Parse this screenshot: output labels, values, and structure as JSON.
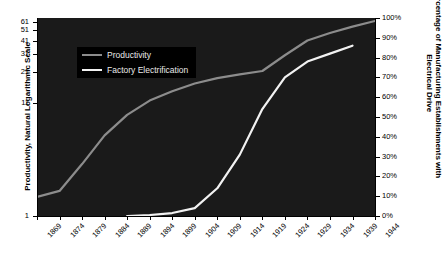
{
  "chart_data": {
    "type": "line",
    "title": "",
    "xlabel": "",
    "background": "#1a1a1a",
    "grid": false,
    "legend_position": "top-left",
    "x": [
      1869,
      1874,
      1879,
      1884,
      1889,
      1894,
      1899,
      1904,
      1909,
      1914,
      1919,
      1924,
      1929,
      1934,
      1939,
      1944
    ],
    "x_tick_labels": [
      "1869",
      "1874",
      "1879",
      "1884",
      "1889",
      "1894",
      "1899",
      "1904",
      "1909",
      "1914",
      "1919",
      "1924",
      "1929",
      "1934",
      "1939",
      "1944"
    ],
    "axes": [
      {
        "id": "left",
        "label": "Productivity, Natural Logarithmic Scale",
        "scale": "log",
        "tick_labels": [
          "1",
          "11",
          "21",
          "31",
          "41",
          "51",
          "61"
        ],
        "tick_values": [
          1,
          11,
          21,
          31,
          41,
          51,
          61
        ],
        "ylim": [
          1,
          66
        ]
      },
      {
        "id": "right",
        "label": "Percentage of Manufacturing Establishments with Electrical Drive",
        "scale": "linear",
        "tick_labels": [
          "0%",
          "10%",
          "20%",
          "30%",
          "40%",
          "50%",
          "60%",
          "70%",
          "80%",
          "90%",
          "100%"
        ],
        "tick_values": [
          0,
          10,
          20,
          30,
          40,
          50,
          60,
          70,
          80,
          90,
          100
        ],
        "ylim": [
          0,
          100
        ]
      }
    ],
    "series": [
      {
        "name": "Productivity",
        "axis": "left",
        "color": "#8c8c8c",
        "x": [
          1869,
          1874,
          1879,
          1884,
          1889,
          1894,
          1899,
          1904,
          1909,
          1914,
          1919,
          1924,
          1929,
          1934,
          1939,
          1944
        ],
        "values": [
          1.5,
          1.7,
          3.0,
          5.5,
          8.5,
          11.5,
          14.0,
          16.5,
          18.5,
          20.0,
          21.5,
          30.0,
          41.0,
          48.0,
          55.0,
          62.0
        ]
      },
      {
        "name": "Factory Electrification",
        "axis": "right",
        "color": "#f2f2f2",
        "x": [
          1889,
          1894,
          1899,
          1904,
          1909,
          1914,
          1919,
          1924,
          1929,
          1934,
          1939
        ],
        "values": [
          0.0,
          0.5,
          1.5,
          4.0,
          14.0,
          31.0,
          54.0,
          70.0,
          78.0,
          82.0,
          86.0
        ]
      }
    ],
    "legend": [
      {
        "label": "Productivity",
        "color": "#8c8c8c"
      },
      {
        "label": "Factory Electrification",
        "color": "#f2f2f2"
      }
    ]
  }
}
